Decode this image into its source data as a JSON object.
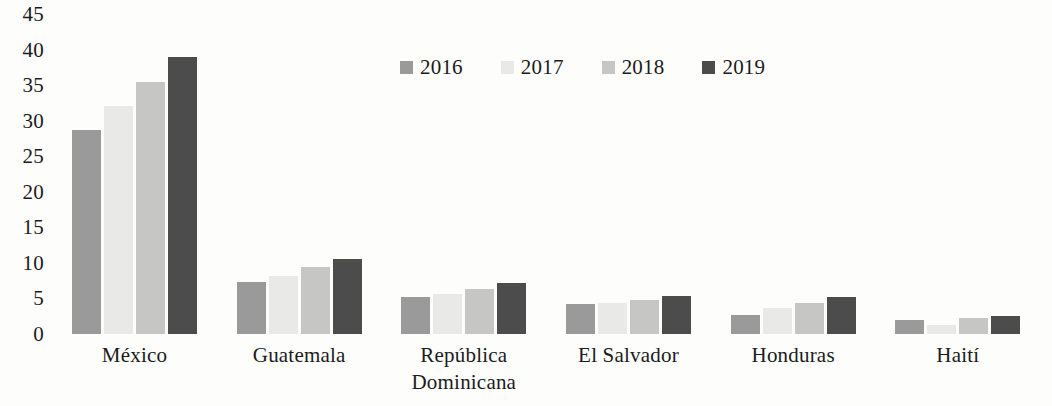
{
  "chart_data": {
    "type": "bar",
    "title": "",
    "subtitle": "",
    "xlabel": "",
    "ylabel": "",
    "categories": [
      "México",
      "Guatemala",
      "República Dominicana",
      "El Salvador",
      "Honduras",
      "Haití"
    ],
    "series": [
      {
        "name": "2016",
        "color": "#9a9a9a",
        "values": [
          28.7,
          7.3,
          5.2,
          4.2,
          2.7,
          2.0
        ]
      },
      {
        "name": "2017",
        "color": "#e9e9e7",
        "values": [
          32.0,
          8.2,
          5.6,
          4.4,
          3.6,
          1.3
        ]
      },
      {
        "name": "2018",
        "color": "#c6c6c4",
        "values": [
          35.5,
          9.4,
          6.3,
          4.8,
          4.4,
          2.3
        ]
      },
      {
        "name": "2019",
        "color": "#4c4c4c",
        "values": [
          39.0,
          10.5,
          7.2,
          5.4,
          5.2,
          2.6
        ]
      }
    ],
    "ylim": [
      0,
      45
    ],
    "ytick_labels": [
      "45",
      "40",
      "35",
      "30",
      "25",
      "20",
      "15",
      "10",
      "5",
      "0"
    ],
    "ytick_values": [
      45,
      40,
      35,
      30,
      25,
      20,
      15,
      10,
      5,
      0
    ],
    "grid": false,
    "axis_line": false,
    "legend_position": "top-center",
    "legend_entries": [
      "2016",
      "2017",
      "2018",
      "2019"
    ]
  }
}
